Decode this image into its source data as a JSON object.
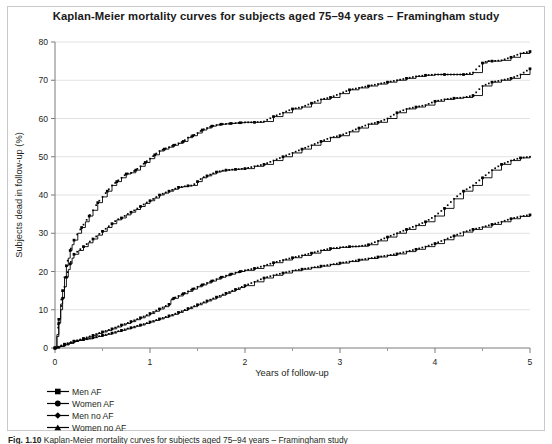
{
  "figure": {
    "title": "Kaplan-Meier mortality curves for subjects aged 75–94 years – Framingham study",
    "caption_prefix": "Fig. 1.10",
    "caption_text": "Kaplan-Meier mortality curves for subjects aged 75–94 years – Framingham study"
  },
  "legend": {
    "position": "below-plot-left",
    "items": [
      {
        "label": "Men AF",
        "marker": "square",
        "color": "#000000"
      },
      {
        "label": "Women AF",
        "marker": "circle",
        "color": "#000000"
      },
      {
        "label": "Men no AF",
        "marker": "diamond",
        "color": "#000000"
      },
      {
        "label": "Women no AF",
        "marker": "triangle",
        "color": "#000000"
      }
    ]
  },
  "chart_data": {
    "type": "line",
    "title": "Kaplan-Meier mortality curves for subjects aged 75–94 years – Framingham study",
    "xlabel": "Years of follow-up",
    "ylabel": "Subjects dead in follow-up (%)",
    "xlim": [
      0,
      5
    ],
    "ylim": [
      0,
      80
    ],
    "xticks": [
      0,
      1,
      2,
      3,
      4,
      5
    ],
    "xtick_labels": [
      "0",
      "1",
      "2",
      "3",
      "4",
      "5"
    ],
    "xminor_ticks": [
      0.5,
      1.5,
      2.5,
      3.5,
      4.5
    ],
    "yticks": [
      0,
      10,
      20,
      30,
      40,
      50,
      60,
      70,
      80
    ],
    "ytick_labels": [
      "0",
      "10",
      "20",
      "30",
      "40",
      "50",
      "60",
      "70",
      "80"
    ],
    "grid": "horizontal",
    "legend_position": "below",
    "line_color": "#000000",
    "series": [
      {
        "name": "Men AF",
        "marker": "square",
        "end_value": 77.5,
        "x": [
          0,
          0.02,
          0.04,
          0.06,
          0.08,
          0.1,
          0.12,
          0.14,
          0.16,
          0.18,
          0.2,
          0.24,
          0.28,
          0.32,
          0.36,
          0.4,
          0.45,
          0.5,
          0.55,
          0.6,
          0.65,
          0.7,
          0.75,
          0.8,
          0.85,
          0.9,
          0.95,
          1.0,
          1.05,
          1.1,
          1.15,
          1.2,
          1.25,
          1.3,
          1.35,
          1.4,
          1.45,
          1.5,
          1.55,
          1.6,
          1.65,
          1.7,
          1.75,
          1.8,
          1.85,
          1.9,
          1.95,
          2.0,
          2.1,
          2.2,
          2.3,
          2.4,
          2.5,
          2.6,
          2.7,
          2.8,
          2.9,
          3.0,
          3.1,
          3.2,
          3.3,
          3.4,
          3.5,
          3.6,
          3.7,
          3.8,
          3.9,
          4.0,
          4.1,
          4.2,
          4.3,
          4.4,
          4.5,
          4.55,
          4.6,
          4.7,
          4.8,
          4.9,
          5.0
        ],
        "y": [
          0,
          3.5,
          7.5,
          11.5,
          15.0,
          18.5,
          21.5,
          23.5,
          25.5,
          27.0,
          28.2,
          30.0,
          31.5,
          33.0,
          34.5,
          36.0,
          38.0,
          39.5,
          41.0,
          42.5,
          43.5,
          44.5,
          45.5,
          45.8,
          46.5,
          47.5,
          48.5,
          49.5,
          50.5,
          51.5,
          52.0,
          52.5,
          53.0,
          53.5,
          54.0,
          55.0,
          55.5,
          56.2,
          57.0,
          57.5,
          58.0,
          58.3,
          58.5,
          58.6,
          58.7,
          58.8,
          58.9,
          59.0,
          59.0,
          59.2,
          60.5,
          61.5,
          62.5,
          63.0,
          64.0,
          65.0,
          65.5,
          66.5,
          67.5,
          68.0,
          68.5,
          69.0,
          69.5,
          70.0,
          70.5,
          71.0,
          71.3,
          71.5,
          71.5,
          71.5,
          71.5,
          72.0,
          74.5,
          75.0,
          75.0,
          75.2,
          76.0,
          77.0,
          77.5
        ]
      },
      {
        "name": "Women AF",
        "marker": "circle",
        "end_value": 73.0,
        "x": [
          0,
          0.02,
          0.04,
          0.06,
          0.08,
          0.1,
          0.12,
          0.14,
          0.16,
          0.18,
          0.2,
          0.25,
          0.3,
          0.35,
          0.4,
          0.45,
          0.5,
          0.55,
          0.6,
          0.65,
          0.7,
          0.75,
          0.8,
          0.85,
          0.9,
          0.95,
          1.0,
          1.05,
          1.1,
          1.15,
          1.2,
          1.25,
          1.3,
          1.35,
          1.4,
          1.45,
          1.5,
          1.55,
          1.6,
          1.65,
          1.7,
          1.75,
          1.8,
          1.85,
          1.9,
          1.95,
          2.0,
          2.1,
          2.2,
          2.3,
          2.4,
          2.5,
          2.6,
          2.7,
          2.8,
          2.9,
          3.0,
          3.1,
          3.2,
          3.3,
          3.4,
          3.5,
          3.6,
          3.7,
          3.8,
          3.9,
          4.0,
          4.1,
          4.2,
          4.3,
          4.4,
          4.5,
          4.6,
          4.7,
          4.8,
          4.9,
          5.0
        ],
        "y": [
          0,
          3.0,
          6.5,
          10.0,
          13.0,
          16.0,
          18.5,
          20.5,
          22.0,
          23.5,
          24.5,
          25.5,
          26.5,
          27.5,
          28.5,
          29.5,
          30.5,
          31.5,
          32.5,
          33.5,
          34.0,
          34.8,
          35.5,
          36.2,
          37.0,
          37.8,
          38.5,
          39.2,
          40.0,
          40.5,
          41.0,
          41.5,
          42.0,
          42.2,
          42.4,
          42.5,
          43.5,
          44.5,
          45.0,
          45.5,
          46.0,
          46.3,
          46.5,
          46.6,
          46.7,
          46.8,
          46.9,
          47.5,
          48.0,
          49.0,
          50.0,
          51.0,
          52.0,
          53.0,
          54.0,
          55.0,
          55.5,
          56.5,
          57.5,
          58.5,
          59.0,
          60.0,
          61.5,
          62.5,
          63.0,
          63.5,
          64.5,
          65.0,
          65.3,
          65.5,
          66.0,
          68.5,
          69.5,
          70.0,
          70.5,
          71.5,
          73.0
        ]
      },
      {
        "name": "Men no AF",
        "marker": "diamond",
        "end_value": 50.0,
        "x": [
          0,
          0.05,
          0.1,
          0.15,
          0.2,
          0.25,
          0.3,
          0.35,
          0.4,
          0.45,
          0.5,
          0.55,
          0.6,
          0.65,
          0.7,
          0.75,
          0.8,
          0.85,
          0.9,
          0.95,
          1.0,
          1.05,
          1.1,
          1.15,
          1.2,
          1.22,
          1.25,
          1.3,
          1.35,
          1.4,
          1.45,
          1.5,
          1.55,
          1.6,
          1.65,
          1.7,
          1.75,
          1.8,
          1.85,
          1.9,
          1.95,
          2.0,
          2.1,
          2.2,
          2.3,
          2.4,
          2.5,
          2.6,
          2.7,
          2.8,
          2.9,
          3.0,
          3.1,
          3.2,
          3.3,
          3.4,
          3.5,
          3.6,
          3.7,
          3.8,
          3.9,
          4.0,
          4.1,
          4.2,
          4.3,
          4.4,
          4.5,
          4.6,
          4.7,
          4.8,
          4.9,
          5.0
        ],
        "y": [
          0,
          0.4,
          0.8,
          1.2,
          1.7,
          2.1,
          2.5,
          2.9,
          3.3,
          3.8,
          4.2,
          4.6,
          5.0,
          5.5,
          6.0,
          6.4,
          6.9,
          7.4,
          7.9,
          8.4,
          9.0,
          9.6,
          10.2,
          10.8,
          11.4,
          12.6,
          13.0,
          13.6,
          14.2,
          14.8,
          15.4,
          16.0,
          16.5,
          17.0,
          17.5,
          18.0,
          18.5,
          18.9,
          19.3,
          19.7,
          20.0,
          20.3,
          20.8,
          21.5,
          22.3,
          23.0,
          23.6,
          24.2,
          24.8,
          25.5,
          26.0,
          26.3,
          26.5,
          26.6,
          27.0,
          28.0,
          29.0,
          30.0,
          31.0,
          32.0,
          33.0,
          34.5,
          36.5,
          39.0,
          41.0,
          42.5,
          44.5,
          46.5,
          48.0,
          49.0,
          49.7,
          50.0
        ]
      },
      {
        "name": "Women no AF",
        "marker": "triangle",
        "end_value": 34.8,
        "x": [
          0,
          0.05,
          0.1,
          0.15,
          0.2,
          0.25,
          0.3,
          0.35,
          0.4,
          0.45,
          0.5,
          0.55,
          0.6,
          0.65,
          0.7,
          0.75,
          0.8,
          0.85,
          0.9,
          0.95,
          1.0,
          1.05,
          1.1,
          1.15,
          1.2,
          1.25,
          1.3,
          1.35,
          1.4,
          1.45,
          1.5,
          1.55,
          1.6,
          1.65,
          1.7,
          1.75,
          1.8,
          1.85,
          1.9,
          1.95,
          2.0,
          2.1,
          2.2,
          2.3,
          2.4,
          2.5,
          2.6,
          2.7,
          2.8,
          2.9,
          3.0,
          3.1,
          3.2,
          3.3,
          3.4,
          3.5,
          3.6,
          3.7,
          3.8,
          3.9,
          4.0,
          4.1,
          4.2,
          4.3,
          4.4,
          4.5,
          4.6,
          4.7,
          4.8,
          4.9,
          5.0
        ],
        "y": [
          0,
          0.5,
          1.0,
          1.4,
          1.8,
          2.0,
          2.2,
          2.4,
          2.7,
          3.0,
          3.3,
          3.6,
          3.9,
          4.3,
          4.6,
          5.0,
          5.3,
          5.7,
          6.0,
          6.4,
          6.8,
          7.2,
          7.6,
          8.0,
          8.4,
          8.8,
          9.3,
          9.8,
          10.3,
          10.8,
          11.3,
          11.8,
          12.3,
          12.8,
          13.3,
          13.8,
          14.3,
          14.8,
          15.3,
          15.8,
          16.3,
          17.3,
          18.3,
          19.0,
          19.6,
          20.2,
          20.6,
          21.0,
          21.4,
          21.8,
          22.2,
          22.6,
          23.0,
          23.4,
          23.8,
          24.2,
          24.6,
          25.2,
          25.8,
          26.5,
          27.3,
          28.3,
          29.3,
          30.3,
          31.0,
          31.6,
          32.3,
          33.0,
          33.8,
          34.4,
          34.8
        ]
      }
    ]
  }
}
